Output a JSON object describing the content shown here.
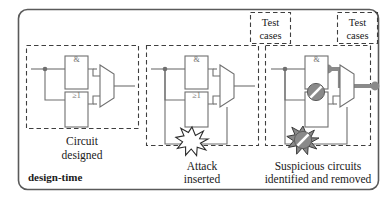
{
  "figure": {
    "name": "design-time-hardware-trojan-pipeline",
    "stage_label": "design-time",
    "frame_color": "#555555",
    "wire_color": "#6f6f6f",
    "highlight_color": "#8a8a8a",
    "dashed_color": "#4a4a4a"
  },
  "panels": [
    {
      "id": "panel-circuit-designed",
      "caption_line1": "Circuit",
      "caption_line2": "designed",
      "gate_and": "&",
      "gate_or": "≥1"
    },
    {
      "id": "panel-attack-inserted",
      "caption_line1": "Attack",
      "caption_line2": "inserted",
      "gate_and": "&",
      "gate_or": "≥1"
    },
    {
      "id": "panel-suspicious-removed",
      "caption_line1": "Suspicious circuits",
      "caption_line2": "identified and removed",
      "gate_and": "&",
      "gate_or": "≥1"
    }
  ],
  "test_case_boxes": [
    {
      "id": "test-cases-middle",
      "line1": "Test",
      "line2": "cases"
    },
    {
      "id": "test-cases-right",
      "line1": "Test",
      "line2": "cases"
    }
  ]
}
